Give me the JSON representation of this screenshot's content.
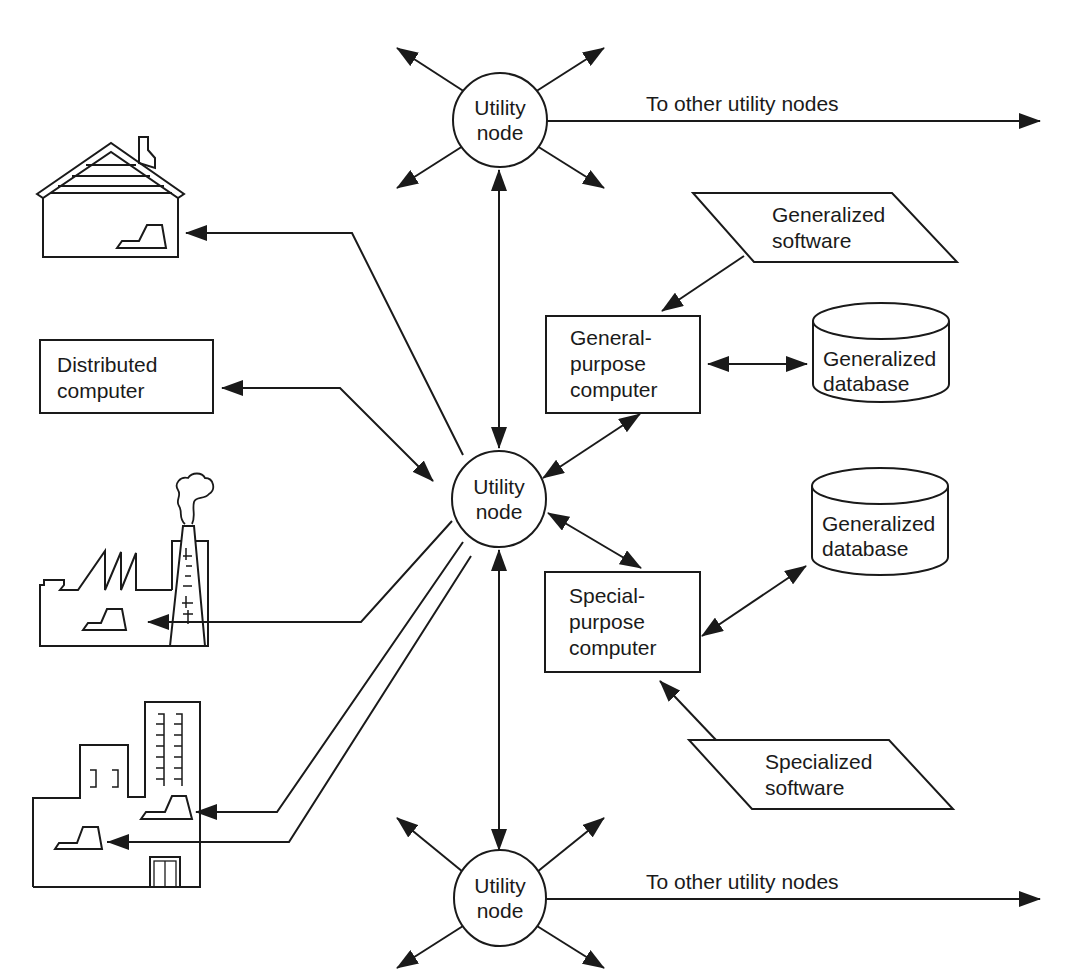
{
  "diagram": {
    "type": "network-diagram",
    "utility_nodes": [
      {
        "id": "top",
        "line1": "Utility",
        "line2": "node",
        "link_label": "To other utility nodes"
      },
      {
        "id": "center",
        "line1": "Utility",
        "line2": "node"
      },
      {
        "id": "bottom",
        "line1": "Utility",
        "line2": "node",
        "link_label": "To other utility nodes"
      }
    ],
    "distributed_computer": {
      "line1": "Distributed",
      "line2": "computer"
    },
    "general_purpose_computer": {
      "line1": "General-",
      "line2": "purpose",
      "line3": "computer"
    },
    "special_purpose_computer": {
      "line1": "Special-",
      "line2": "purpose",
      "line3": "computer"
    },
    "generalized_software": {
      "line1": "Generalized",
      "line2": "software"
    },
    "specialized_software": {
      "line1": "Specialized",
      "line2": "software"
    },
    "databases": [
      {
        "line1": "Generalized",
        "line2": "database"
      },
      {
        "line1": "Generalized",
        "line2": "database"
      }
    ],
    "endpoints": [
      {
        "icon": "house-icon",
        "label": ""
      },
      {
        "icon": "factory-icon",
        "label": ""
      },
      {
        "icon": "office-building-icon",
        "label": ""
      }
    ],
    "colors": {
      "stroke": "#1a1a1a",
      "background": "#ffffff"
    }
  }
}
